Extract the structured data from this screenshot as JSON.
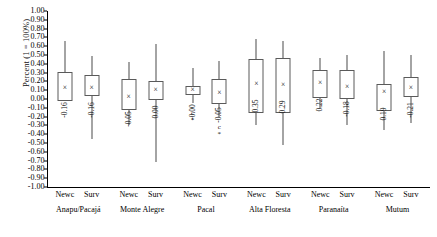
{
  "chart_data": {
    "type": "box",
    "title": "",
    "xlabel": "",
    "ylabel": "Percent (1 = 100%)",
    "ylim": [
      -1.0,
      1.0
    ],
    "ytick_step": 0.1,
    "grid": false,
    "legend": "none",
    "ytick_labels": [
      "1.00",
      "0.90",
      "0.80",
      "0.70",
      "0.60",
      "0.50",
      "0.40",
      "0.30",
      "0.20",
      "0.10",
      "0.00",
      "-0.10",
      "-0.20",
      "-0.30",
      "-0.40",
      "-0.50",
      "-0.60",
      "-0.70",
      "-0.80",
      "-0.90",
      "-1.00"
    ],
    "ytick_values": [
      1.0,
      0.9,
      0.8,
      0.7,
      0.6,
      0.5,
      0.4,
      0.3,
      0.2,
      0.1,
      0.0,
      -0.1,
      -0.2,
      -0.3,
      -0.4,
      -0.5,
      -0.6,
      -0.7,
      -0.8,
      -0.9,
      -1.0
    ],
    "groups": [
      "Anapu/Pacajá",
      "Monte Alegre",
      "Pacal",
      "Alta Floresta",
      "Paranaíta",
      "Mutum"
    ],
    "subcategories": [
      "Newc",
      "Surv"
    ],
    "mean_marker": "×",
    "boxes": [
      {
        "group": "Anapu/Pacajá",
        "sub": "Newc",
        "label": "-0.16",
        "whisker_low": -0.02,
        "q1": -0.02,
        "median": 0.13,
        "q3": 0.31,
        "whisker_high": 0.66,
        "mean": 0.13,
        "outliers": []
      },
      {
        "group": "Anapu/Pacajá",
        "sub": "Surv",
        "label": "-0.16",
        "whisker_low": -0.45,
        "q1": 0.03,
        "median": 0.13,
        "q3": 0.27,
        "whisker_high": 0.49,
        "mean": 0.13,
        "outliers": []
      },
      {
        "group": "Monte Alegre",
        "sub": "Newc",
        "label": "-0.05",
        "whisker_low": -0.29,
        "q1": -0.12,
        "median": 0.02,
        "q3": 0.23,
        "whisker_high": 0.42,
        "mean": 0.02,
        "outliers": []
      },
      {
        "group": "Monte Alegre",
        "sub": "Surv",
        "label": "0.00",
        "whisker_low": -0.72,
        "q1": -0.01,
        "median": 0.1,
        "q3": 0.2,
        "whisker_high": 0.62,
        "mean": 0.1,
        "outliers": []
      },
      {
        "group": "Pacal",
        "sub": "Newc",
        "label": "-0.00",
        "whisker_low": -0.04,
        "q1": 0.05,
        "median": 0.1,
        "q3": 0.15,
        "whisker_high": 0.35,
        "mean": 0.1,
        "outliers": [
          "c",
          "*"
        ]
      },
      {
        "group": "Pacal",
        "sub": "Surv",
        "label": "-0.05",
        "whisker_low": -0.2,
        "q1": -0.06,
        "median": 0.07,
        "q3": 0.23,
        "whisker_high": 0.43,
        "mean": 0.07,
        "outliers": [
          "c",
          "*"
        ]
      },
      {
        "group": "Alta Floresta",
        "sub": "Newc",
        "label": "0.35",
        "whisker_low": -0.3,
        "q1": -0.16,
        "median": 0.17,
        "q3": 0.46,
        "whisker_high": 0.68,
        "mean": 0.17,
        "outliers": []
      },
      {
        "group": "Alta Floresta",
        "sub": "Surv",
        "label": "0.29",
        "whisker_low": -0.52,
        "q1": -0.16,
        "median": 0.16,
        "q3": 0.47,
        "whisker_high": 0.66,
        "mean": 0.16,
        "outliers": []
      },
      {
        "group": "Paranaíta",
        "sub": "Newc",
        "label": "0.22",
        "whisker_low": -0.1,
        "q1": 0.01,
        "median": 0.18,
        "q3": 0.33,
        "whisker_high": 0.47,
        "mean": 0.18,
        "outliers": []
      },
      {
        "group": "Paranaíta",
        "sub": "Surv",
        "label": "-0.18",
        "whisker_low": -0.3,
        "q1": 0.0,
        "median": 0.14,
        "q3": 0.33,
        "whisker_high": 0.5,
        "mean": 0.14,
        "outliers": []
      },
      {
        "group": "Mutum",
        "sub": "Newc",
        "label": "0.19",
        "whisker_low": -0.35,
        "q1": -0.14,
        "median": 0.08,
        "q3": 0.17,
        "whisker_high": 0.54,
        "mean": 0.08,
        "outliers": []
      },
      {
        "group": "Mutum",
        "sub": "Surv",
        "label": "-0.21",
        "whisker_low": -0.27,
        "q1": 0.02,
        "median": 0.13,
        "q3": 0.25,
        "whisker_high": 0.5,
        "mean": 0.13,
        "outliers": []
      }
    ]
  }
}
